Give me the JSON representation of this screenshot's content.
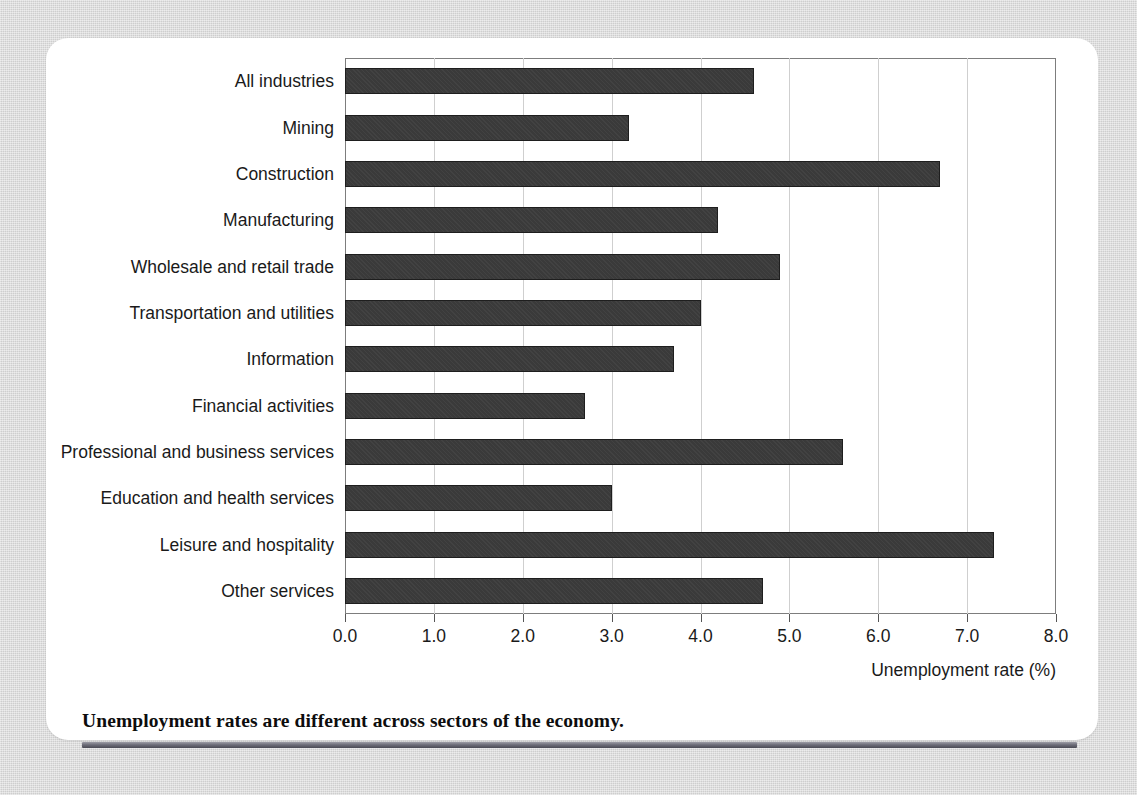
{
  "chart_data": {
    "type": "bar",
    "orientation": "horizontal",
    "title": "",
    "subtitle": "",
    "xlabel": "Unemployment rate (%)",
    "ylabel": "",
    "xlim": [
      0.0,
      8.0
    ],
    "xticks": [
      "0.0",
      "1.0",
      "2.0",
      "3.0",
      "4.0",
      "5.0",
      "6.0",
      "7.0",
      "8.0"
    ],
    "xtick_values": [
      0,
      1,
      2,
      3,
      4,
      5,
      6,
      7,
      8
    ],
    "grid": "vertical",
    "legend": "none",
    "bar_color": "#3a3a3a",
    "categories": [
      "All industries",
      "Mining",
      "Construction",
      "Manufacturing",
      "Wholesale and retail trade",
      "Transportation and utilities",
      "Information",
      "Financial activities",
      "Professional and business services",
      "Education and health services",
      "Leisure and hospitality",
      "Other services"
    ],
    "values": [
      4.6,
      3.2,
      6.7,
      4.2,
      4.9,
      4.0,
      3.7,
      2.7,
      5.6,
      3.0,
      7.3,
      4.7
    ]
  },
  "caption": {
    "text": "Unemployment rates are different across sectors of the economy."
  },
  "colors": {
    "page_background": "#d6d6d6",
    "card_background": "#ffffff",
    "bar": "#3a3a3a",
    "bar_border": "#1e1e1e",
    "gridline": "#cfcfcf",
    "axis": "#7d7d7d",
    "text": "#1a1a1a",
    "rule": "#6f6f7a"
  }
}
